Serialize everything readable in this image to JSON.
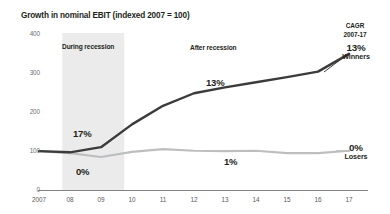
{
  "chart_data": {
    "type": "line",
    "title": "Growth in nominal EBIT (indexed 2007 = 100)",
    "xlabel": "",
    "ylabel": "",
    "xlim": [
      2007,
      2017
    ],
    "ylim": [
      0,
      400
    ],
    "yticks": [
      0,
      100,
      200,
      300,
      400
    ],
    "ytick_labels": [
      "0",
      "100",
      "200",
      "300",
      "400"
    ],
    "grid": false,
    "legend_position": "right-inline",
    "x": [
      2007,
      2008,
      2009,
      2010,
      2011,
      2012,
      2013,
      2014,
      2015,
      2016,
      2017
    ],
    "xtick_labels": [
      "2007",
      "08",
      "09",
      "10",
      "11",
      "12",
      "13",
      "14",
      "15",
      "16",
      "17"
    ],
    "series": [
      {
        "name": "Winners",
        "color": "#3b3b3b",
        "cagr_label": "13%",
        "values": [
          100,
          97,
          110,
          168,
          215,
          247,
          262,
          275,
          288,
          302,
          347
        ]
      },
      {
        "name": "Losers",
        "color": "#bcbec0",
        "cagr_label": "0%",
        "values": [
          100,
          95,
          85,
          98,
          105,
          101,
          100,
          101,
          95,
          95,
          101
        ]
      }
    ],
    "shaded_region": {
      "label": "During recession",
      "x_start": 2007.75,
      "x_end": 2009.75,
      "color": "#ebebeb"
    },
    "annotations": [
      {
        "text": "After recession",
        "kind": "period-label"
      },
      {
        "text": "17%",
        "kind": "growth-rate",
        "series": "Winners",
        "period": "during-recession"
      },
      {
        "text": "0%",
        "kind": "growth-rate",
        "series": "Losers",
        "period": "during-recession"
      },
      {
        "text": "13%",
        "kind": "growth-rate",
        "series": "Winners",
        "period": "after-recession"
      },
      {
        "text": "1%",
        "kind": "growth-rate",
        "series": "Losers",
        "period": "after-recession"
      }
    ],
    "cagr_header": {
      "line1": "CAGR",
      "line2": "2007-17"
    }
  }
}
